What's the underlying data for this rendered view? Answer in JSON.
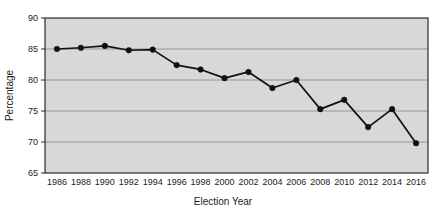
{
  "chart_data": {
    "type": "line",
    "title": "",
    "xlabel": "Election Year",
    "ylabel": "Percentage",
    "categories": [
      1986,
      1988,
      1990,
      1992,
      1994,
      1996,
      1998,
      2000,
      2002,
      2004,
      2006,
      2008,
      2010,
      2012,
      2014,
      2016
    ],
    "x_tick_labels": [
      "1986",
      "1988",
      "1990",
      "1992",
      "1994",
      "1996",
      "1998",
      "2000",
      "2002",
      "2004",
      "2006",
      "2008",
      "2010",
      "2012",
      "2014",
      "2016"
    ],
    "values": [
      85.0,
      85.2,
      85.5,
      84.8,
      84.9,
      82.4,
      81.7,
      80.3,
      81.3,
      78.7,
      80.0,
      75.3,
      76.8,
      72.4,
      75.3,
      69.8
    ],
    "y_tick_labels": [
      "65",
      "70",
      "75",
      "80",
      "85",
      "90"
    ],
    "y_ticks": [
      65,
      70,
      75,
      80,
      85,
      90
    ],
    "ylim": [
      65,
      90
    ],
    "xlim": [
      1985,
      2017
    ],
    "grid": true,
    "gridlines_at": [
      70,
      75,
      80,
      85
    ],
    "legend": "none",
    "series_name": "Percentage",
    "colors": {
      "line": "#111111",
      "marker": "#111111",
      "plot_background": "#d8d8d8",
      "gridline": "#8f8f8f",
      "axis": "#2b2b2b",
      "page_background": "#ffffff"
    }
  }
}
